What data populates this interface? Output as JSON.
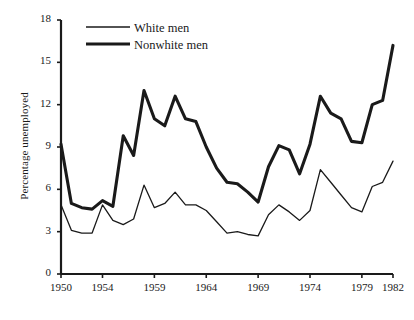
{
  "chart_data": {
    "type": "line",
    "title": "",
    "xlabel": "",
    "ylabel": "Percentage unemployed",
    "xlim": [
      1950,
      1982
    ],
    "ylim": [
      0,
      18
    ],
    "grid": false,
    "legend_position": "top-left-inside",
    "x_ticks": [
      1950,
      1954,
      1959,
      1964,
      1969,
      1974,
      1979,
      1982
    ],
    "x_tick_labels": [
      "1950",
      "1954",
      "1959",
      "1964",
      "1969",
      "1974",
      "1979",
      "1982"
    ],
    "y_ticks": [
      0,
      3,
      6,
      9,
      12,
      15,
      18
    ],
    "y_tick_labels": [
      "0",
      "3",
      "6",
      "9",
      "12",
      "15",
      "18"
    ],
    "x": [
      1950,
      1951,
      1952,
      1953,
      1954,
      1955,
      1956,
      1957,
      1958,
      1959,
      1960,
      1961,
      1962,
      1963,
      1964,
      1965,
      1966,
      1967,
      1968,
      1969,
      1970,
      1971,
      1972,
      1973,
      1974,
      1975,
      1976,
      1977,
      1978,
      1979,
      1980,
      1981,
      1982
    ],
    "series": [
      {
        "name": "White men",
        "line_style": "thin",
        "color": "#1a1a1a",
        "values": [
          4.9,
          3.1,
          2.9,
          2.9,
          4.9,
          3.8,
          3.5,
          3.9,
          6.3,
          4.7,
          5.0,
          5.8,
          4.9,
          4.9,
          4.5,
          3.7,
          2.9,
          3.0,
          2.8,
          2.7,
          4.2,
          4.9,
          4.4,
          3.8,
          4.5,
          7.4,
          6.5,
          5.6,
          4.7,
          4.4,
          6.2,
          6.5,
          8.0
        ]
      },
      {
        "name": "Nonwhite men",
        "line_style": "thick",
        "color": "#1a1a1a",
        "values": [
          9.2,
          5.0,
          4.7,
          4.6,
          5.2,
          4.8,
          9.8,
          8.4,
          13.0,
          11.0,
          10.5,
          12.6,
          11.0,
          10.8,
          9.0,
          7.5,
          6.5,
          6.4,
          5.8,
          5.1,
          7.6,
          9.1,
          8.8,
          7.1,
          9.2,
          12.6,
          11.4,
          11.0,
          9.4,
          9.3,
          12.0,
          12.3,
          16.2
        ]
      }
    ]
  },
  "legend": {
    "entries": [
      {
        "label": "White men",
        "style": "thin"
      },
      {
        "label": "Nonwhite men",
        "style": "thick"
      }
    ]
  }
}
